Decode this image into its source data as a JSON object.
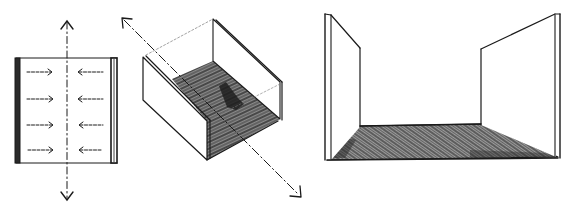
{
  "figure": {
    "description": "Three hand-drawn sketches illustrating spatial enclosure: plan view of two parallel walls with inward arrows, isometric U-shaped channel with hatched floor and directional axis, and perspective view of two walls with hatched floor plane",
    "panels": [
      {
        "id": "plan-parallel-walls",
        "label": "Plan view: two parallel walls with inward-pointing arrows and vertical dash-dot axis with arrowheads at both ends",
        "arrow_rows": 4,
        "left_arrows_direction": "right",
        "right_arrows_direction": "left",
        "axis": "vertical, double-headed, dash-dot"
      },
      {
        "id": "isometric-u-channel",
        "label": "Isometric view: U-shaped channel of two walls on a hatched base plane, diagonal double-headed dash-dot axis passing through",
        "axis": "diagonal, double-headed, dash-dot",
        "floor_fill": "hatched"
      },
      {
        "id": "perspective-walls-floor",
        "label": "Perspective view: two vertical wall planes standing on a hatched floor plane",
        "floor_fill": "hatched"
      }
    ],
    "colors": {
      "ink": "#1a1a1a",
      "paper": "#ffffff",
      "hatch_dark": "#2b2b2b",
      "hatch_mid": "#7a7a7a"
    }
  }
}
